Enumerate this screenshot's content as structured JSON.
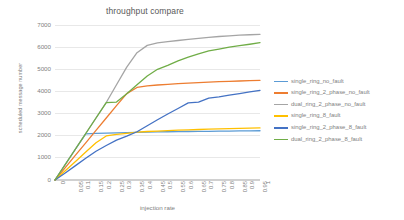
{
  "chart_data": {
    "type": "line",
    "title": "throughput compare",
    "xlabel": "injection rate",
    "ylabel": "scheduled message number",
    "xlim": [
      0,
      1
    ],
    "ylim": [
      0,
      7000
    ],
    "grid": true,
    "legend_position": "right",
    "x": [
      0,
      0.05,
      0.1,
      0.15,
      0.2,
      0.25,
      0.3,
      0.35,
      0.4,
      0.45,
      0.5,
      0.55,
      0.6,
      0.65,
      0.7,
      0.75,
      0.8,
      0.85,
      0.9,
      0.95,
      1
    ],
    "xticklabels": [
      "0",
      "0.05",
      "0.1",
      "0.15",
      "0.2",
      "0.25",
      "0.3",
      "0.35",
      "0.4",
      "0.45",
      "0.5",
      "0.55",
      "0.6",
      "0.65",
      "0.7",
      "0.75",
      "0.8",
      "0.85",
      "0.9",
      "0.95",
      "1"
    ],
    "yticklabels": [
      "0",
      "1000",
      "2000",
      "3000",
      "4000",
      "5000",
      "6000",
      "7000"
    ],
    "yticks": [
      0,
      1000,
      2000,
      3000,
      4000,
      5000,
      6000,
      7000
    ],
    "series": [
      {
        "name": "single_ring_no_fault",
        "color": "#5B9BD5",
        "values": [
          0,
          700,
          1400,
          2080,
          2110,
          2120,
          2130,
          2140,
          2150,
          2160,
          2170,
          2180,
          2185,
          2190,
          2195,
          2200,
          2205,
          2210,
          2215,
          2220,
          2225
        ]
      },
      {
        "name": "single_ring_2_phase_no_fault",
        "color": "#ED7D31",
        "values": [
          0,
          560,
          1120,
          1680,
          2240,
          2800,
          3360,
          3900,
          4180,
          4250,
          4290,
          4320,
          4350,
          4375,
          4400,
          4420,
          4440,
          4455,
          4470,
          4485,
          4500
        ]
      },
      {
        "name": "dual_ring_2_phase_no_fault",
        "color": "#A5A5A5",
        "values": [
          0,
          700,
          1400,
          2100,
          2800,
          3500,
          4300,
          5100,
          5750,
          6080,
          6190,
          6250,
          6300,
          6350,
          6400,
          6440,
          6480,
          6510,
          6540,
          6560,
          6580
        ]
      },
      {
        "name": "single_ring_8_fault",
        "color": "#FFC000",
        "values": [
          0,
          420,
          840,
          1260,
          1680,
          1990,
          2060,
          2110,
          2160,
          2190,
          2210,
          2230,
          2250,
          2265,
          2280,
          2295,
          2305,
          2320,
          2330,
          2340,
          2350
        ]
      },
      {
        "name": "single_ring_2_phase_8_fault",
        "color": "#4472C4",
        "values": [
          0,
          320,
          650,
          980,
          1300,
          1560,
          1800,
          1980,
          2180,
          2450,
          2720,
          2980,
          3230,
          3480,
          3520,
          3700,
          3750,
          3830,
          3900,
          3980,
          4050
        ]
      },
      {
        "name": "dual_ring_2_phase_8_fault",
        "color": "#70AD47",
        "values": [
          0,
          700,
          1400,
          2100,
          2800,
          3490,
          3520,
          3900,
          4300,
          4700,
          5000,
          5180,
          5380,
          5550,
          5700,
          5830,
          5910,
          6000,
          6070,
          6130,
          6200
        ]
      }
    ]
  },
  "legend": {
    "items": [
      {
        "label": "single_ring_no_fault",
        "color": "#5B9BD5"
      },
      {
        "label": "single_ring_2_phase_no_fault",
        "color": "#ED7D31"
      },
      {
        "label": "dual_ring_2_phase_no_fault",
        "color": "#A5A5A5"
      },
      {
        "label": "single_ring_8_fault",
        "color": "#FFC000"
      },
      {
        "label": "single_ring_2_phase_8_fault",
        "color": "#4472C4"
      },
      {
        "label": "dual_ring_2_phase_8_fault",
        "color": "#70AD47"
      }
    ]
  }
}
